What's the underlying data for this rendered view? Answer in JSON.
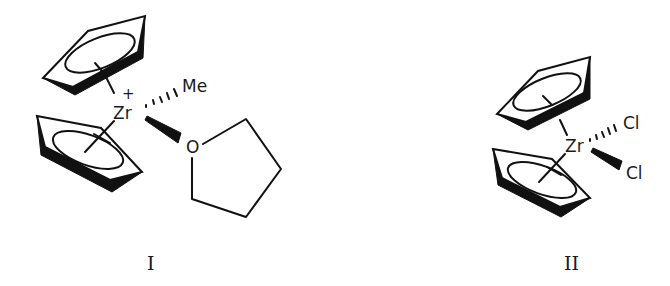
{
  "figure": {
    "structures": [
      {
        "id": "I",
        "caption": "I",
        "metal": "Zr",
        "charge": "+",
        "ligands": {
          "hashed": "Me",
          "wedged": "O",
          "ring": "tetrahydrofuran"
        },
        "cp_rings": 2
      },
      {
        "id": "II",
        "caption": "II",
        "metal": "Zr",
        "ligands": {
          "hashed": "Cl",
          "wedged": "Cl"
        },
        "cp_rings": 2
      }
    ],
    "colors": {
      "ink": "#111111",
      "background": "#ffffff"
    }
  }
}
